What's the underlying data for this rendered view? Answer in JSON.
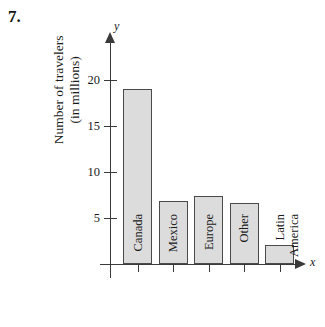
{
  "problem": {
    "number": "7."
  },
  "chart_data": {
    "type": "bar",
    "title": "",
    "subtitle": "",
    "xlabel": "",
    "ylabel": "Number of travelers (in millions)",
    "ylabel_lines": [
      "Number of travelers",
      "(in millions)"
    ],
    "axis_letter_y": "y",
    "axis_letter_x": "x",
    "categories": [
      "Canada",
      "Mexico",
      "Europe",
      "Other",
      "Latin America"
    ],
    "category_lines": [
      [
        "Canada"
      ],
      [
        "Mexico"
      ],
      [
        "Europe"
      ],
      [
        "Other"
      ],
      [
        "Latin",
        "America"
      ]
    ],
    "values": [
      19.0,
      6.9,
      7.4,
      6.6,
      2.1
    ],
    "ylim": [
      0,
      22
    ],
    "yticks": [
      5,
      10,
      15,
      20
    ],
    "ytick_labels": [
      "5",
      "10",
      "15",
      "20"
    ],
    "grid": false,
    "legend": false,
    "bar_fill": "#dcdcdc",
    "bar_stroke": "#4a4a4a",
    "axis_color": "#3a3a3a"
  }
}
